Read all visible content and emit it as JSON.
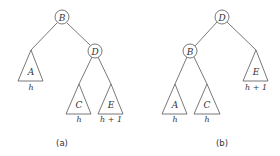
{
  "panel_a": {
    "caption": "(a)",
    "root": {
      "label": "B"
    },
    "right_child": {
      "label": "D"
    },
    "subtrees": [
      {
        "label": "A",
        "height": "h"
      },
      {
        "label": "C",
        "height": "h"
      },
      {
        "label": "E",
        "height": "h + 1"
      }
    ]
  },
  "panel_b": {
    "caption": "(b)",
    "root": {
      "label": "D"
    },
    "left_child": {
      "label": "B"
    },
    "subtrees": [
      {
        "label": "A",
        "height": "h"
      },
      {
        "label": "C",
        "height": "h"
      },
      {
        "label": "E",
        "height": "h + 1"
      }
    ]
  }
}
